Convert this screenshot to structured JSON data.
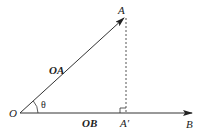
{
  "diagram": {
    "points": {
      "O": {
        "label": "O"
      },
      "A": {
        "label": "A"
      },
      "A_prime": {
        "label": "A′"
      },
      "B": {
        "label": "B"
      }
    },
    "vectors": {
      "OA": {
        "label": "OA"
      },
      "OB": {
        "label": "OB"
      }
    },
    "angle": {
      "label": "θ"
    },
    "colors": {
      "line": "#333333",
      "dashed": "#555555",
      "background": "#ffffff"
    }
  }
}
